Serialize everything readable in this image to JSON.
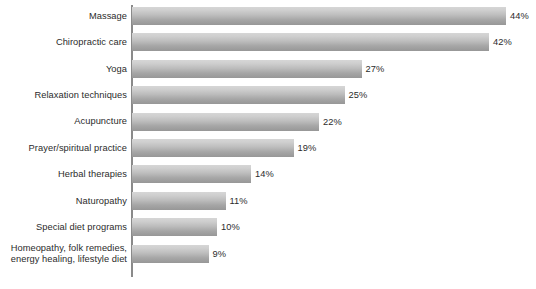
{
  "chart_data": {
    "type": "bar",
    "orientation": "horizontal",
    "title": "",
    "xlabel": "",
    "ylabel": "",
    "grid": false,
    "legend": false,
    "xlim": [
      0,
      44
    ],
    "categories": [
      "Massage",
      "Chiropractic care",
      "Yoga",
      "Relaxation techniques",
      "Acupuncture",
      "Prayer/spiritual practice",
      "Herbal therapies",
      "Naturopathy",
      "Special diet programs",
      "Homeopathy, folk remedies, energy healing, lifestyle diet"
    ],
    "category_lines": [
      [
        "Massage"
      ],
      [
        "Chiropractic care"
      ],
      [
        "Yoga"
      ],
      [
        "Relaxation techniques"
      ],
      [
        "Acupuncture"
      ],
      [
        "Prayer/spiritual practice"
      ],
      [
        "Herbal therapies"
      ],
      [
        "Naturopathy"
      ],
      [
        "Special diet programs"
      ],
      [
        "Homeopathy, folk remedies,",
        "energy healing, lifestyle diet"
      ]
    ],
    "values": [
      44,
      42,
      27,
      25,
      22,
      19,
      14,
      11,
      10,
      9
    ],
    "value_labels": [
      "44%",
      "42%",
      "27%",
      "25%",
      "22%",
      "19%",
      "14%",
      "11%",
      "10%",
      "9%"
    ],
    "unit": "%",
    "colors": {
      "bar_top": "#d6d6d6",
      "bar_bottom": "#979797",
      "axis": "#8a8a8a",
      "text": "#2b2b2b",
      "background": "#ffffff"
    }
  },
  "layout": {
    "axis_x": 132,
    "axis_top": 5,
    "axis_height": 272,
    "bar_height": 18,
    "bar_pitch": 26.4,
    "first_bar_top": 7,
    "px_per_unit": 8.5
  }
}
